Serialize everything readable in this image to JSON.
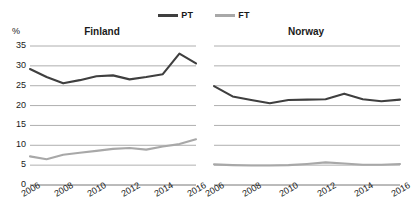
{
  "chart_data": [
    {
      "type": "line",
      "title": "Finland",
      "xlabel": "",
      "ylabel": "%",
      "ylim": [
        0,
        35
      ],
      "yticks": [
        0,
        5,
        10,
        15,
        20,
        25,
        30,
        35
      ],
      "grid": true,
      "legend_position": "top-center",
      "x": [
        2006,
        2007,
        2008,
        2009,
        2010,
        2011,
        2012,
        2013,
        2014,
        2015,
        2016
      ],
      "xtick_labels": [
        "2006",
        "2008",
        "2010",
        "2012",
        "2014",
        "2016"
      ],
      "xticks": [
        2006,
        2008,
        2010,
        2012,
        2014,
        2016
      ],
      "series": [
        {
          "name": "PT",
          "color": "#3f3f3f",
          "values": [
            29.2,
            27.2,
            25.6,
            26.4,
            27.4,
            27.6,
            26.6,
            27.2,
            27.9,
            33.1,
            30.6
          ]
        },
        {
          "name": "FT",
          "color": "#a8a8a8",
          "values": [
            7.2,
            6.5,
            7.6,
            8.1,
            8.6,
            9.1,
            9.3,
            8.9,
            9.7,
            10.3,
            11.5
          ]
        }
      ]
    },
    {
      "type": "line",
      "title": "Norway",
      "xlabel": "",
      "ylabel": "%",
      "ylim": [
        0,
        35
      ],
      "yticks": [
        0,
        5,
        10,
        15,
        20,
        25,
        30,
        35
      ],
      "grid": true,
      "legend_position": "top-center",
      "x": [
        2006,
        2007,
        2008,
        2009,
        2010,
        2011,
        2012,
        2013,
        2014,
        2015,
        2016
      ],
      "xtick_labels": [
        "2006",
        "2008",
        "2010",
        "2012",
        "2014",
        "2016"
      ],
      "xticks": [
        2006,
        2008,
        2010,
        2012,
        2014,
        2016
      ],
      "series": [
        {
          "name": "PT",
          "color": "#3f3f3f",
          "values": [
            24.9,
            22.3,
            21.4,
            20.6,
            21.4,
            21.5,
            21.6,
            23.0,
            21.6,
            21.1,
            21.5
          ]
        },
        {
          "name": "FT",
          "color": "#a8a8a8",
          "values": [
            5.2,
            5.0,
            4.9,
            4.9,
            5.0,
            5.3,
            5.7,
            5.4,
            5.1,
            5.1,
            5.3
          ]
        }
      ]
    }
  ],
  "legend": {
    "items": [
      {
        "label": "PT",
        "color": "#3f3f3f"
      },
      {
        "label": "FT",
        "color": "#a8a8a8"
      }
    ]
  },
  "panels": {
    "left": {
      "title": "Finland",
      "unit": "%"
    },
    "right": {
      "title": "Norway",
      "unit": ""
    }
  },
  "colors": {
    "pt_line": "#3f3f3f",
    "ft_line": "#a8a8a8",
    "gridline": "#9a9a9a",
    "text": "#1a1a1a",
    "background": "#ffffff"
  }
}
